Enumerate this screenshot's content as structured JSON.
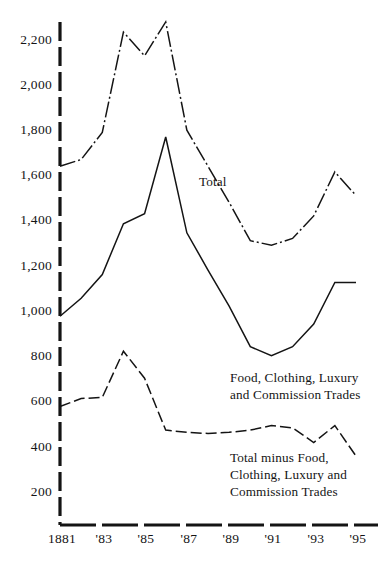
{
  "chart_data": {
    "type": "line",
    "title": "",
    "subtitle": "",
    "xlabel": "",
    "ylabel": "",
    "grid": false,
    "legend_position": "inline-annotations",
    "x": [
      1881,
      1882,
      1883,
      1884,
      1885,
      1886,
      1887,
      1888,
      1889,
      1890,
      1891,
      1892,
      1893,
      1894,
      1895
    ],
    "xtick_labels": [
      "1881",
      "",
      "'83",
      "",
      "'85",
      "",
      "'87",
      "",
      "'89",
      "",
      "'91",
      "",
      "'93",
      "",
      "'95"
    ],
    "ytick_labels": [
      "2,200",
      "2,000",
      "1,800",
      "1,600",
      "1,400",
      "1,200",
      "1,000",
      "800",
      "600",
      "400",
      "200"
    ],
    "ytick_values": [
      2200,
      2000,
      1800,
      1600,
      1400,
      1200,
      1000,
      800,
      600,
      400,
      200
    ],
    "xlim": [
      1881,
      1895
    ],
    "ylim": [
      0,
      2320
    ],
    "series": [
      {
        "name": "Total",
        "label": "Total",
        "style": "dash-dot",
        "color": "#141414",
        "values": [
          1640,
          1670,
          1790,
          2235,
          2130,
          2280,
          1800,
          1640,
          1480,
          1310,
          1290,
          1320,
          1420,
          1615,
          1510
        ]
      },
      {
        "name": "Food, Clothing, Luxury and Commission Trades",
        "label": "Food, Clothing, Luxury\nand Commission Trades",
        "style": "solid",
        "color": "#141414",
        "values": [
          975,
          1055,
          1160,
          1385,
          1430,
          1770,
          1345,
          1180,
          1020,
          840,
          800,
          840,
          940,
          1125,
          1125
        ]
      },
      {
        "name": "Total minus Food, Clothing, Luxury and Commission Trades",
        "label": "Total minus Food,\nClothing, Luxury and\nCommission Trades",
        "style": "dashed",
        "color": "#141414",
        "values": [
          575,
          610,
          615,
          820,
          700,
          470,
          460,
          455,
          460,
          470,
          490,
          480,
          415,
          490,
          355
        ]
      }
    ],
    "annotations": [
      {
        "text": "Total",
        "x": 1889,
        "y": 1690
      },
      {
        "text": "Food, Clothing, Luxury\nand Commission Trades",
        "x": 1888,
        "y": 740
      },
      {
        "text": "Total minus Food,\nClothing, Luxury and\nCommission Trades",
        "x": 1889,
        "y": 330
      }
    ]
  },
  "axes": {
    "y_axis_style": "dashed-thick",
    "x_axis_style": "dashed-thick",
    "axis_color": "#141414"
  }
}
